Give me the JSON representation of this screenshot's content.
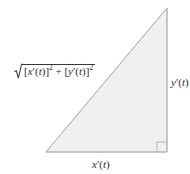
{
  "figure": {
    "name": "right-triangle-arc-length",
    "width": 190,
    "height": 174,
    "background_color": "#ffffff"
  },
  "triangle": {
    "fill_color": "#f0f0f0",
    "stroke_color": "#b9b9b9",
    "stroke_width": 1,
    "vertices": {
      "apex": [
        167,
        8
      ],
      "bottom_left": [
        46,
        152
      ],
      "bottom_right": [
        167,
        152
      ]
    },
    "right_angle_marker": {
      "corner": "bottom-right",
      "size": 10,
      "stroke_color": "#b9b9b9"
    }
  },
  "labels": {
    "hypotenuse": {
      "name": "hypotenuse-label",
      "text": "√([x'(t)]² + [y'(t)]²)",
      "parts": {
        "open_bracket_1": "[",
        "var_x": "x",
        "prime_1": "′",
        "open_paren_1": "(",
        "var_t_1": "t",
        "close_paren_1": ")",
        "close_bracket_1": "]",
        "exp_1": "2",
        "operator": "+",
        "open_bracket_2": "[",
        "var_y": "y",
        "prime_2": "′",
        "open_paren_2": "(",
        "var_t_2": "t",
        "close_paren_2": ")",
        "close_bracket_2": "]",
        "exp_2": "2"
      }
    },
    "vertical_side": {
      "name": "vertical-side-label",
      "text": "y'(t)",
      "parts": {
        "var": "y",
        "prime": "′",
        "open_paren": "(",
        "arg": "t",
        "close_paren": ")"
      }
    },
    "horizontal_side": {
      "name": "horizontal-side-label",
      "text": "x'(t)",
      "parts": {
        "var": "x",
        "prime": "′",
        "open_paren": "(",
        "arg": "t",
        "close_paren": ")"
      }
    }
  }
}
